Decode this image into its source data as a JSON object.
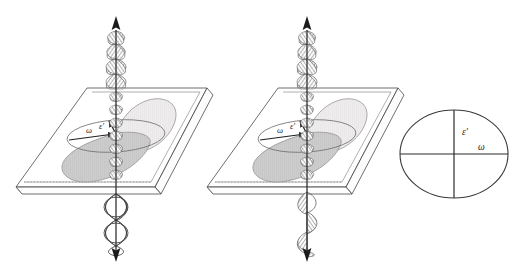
{
  "figure": {
    "type": "optical-polarization-schematic",
    "width": 527,
    "height": 265,
    "background_color": "#ffffff"
  },
  "colors": {
    "stroke": "#3a3a3a",
    "stroke_light": "#8c8c8c",
    "helix_fill": "#8e8e8e",
    "disk_gray": "#c9c9c9",
    "disk_light": "#eceaea",
    "label": "#1a1a1a",
    "dotted": "#9a9a9a"
  },
  "panels": [
    {
      "id": "panel-left",
      "name": "circular-polarization-panel",
      "plate": {
        "name": "birefringent-plate",
        "shape": "parallelogram-slab",
        "hidden_edge_style": "dotted"
      },
      "ellipse_cone": {
        "name": "polarization-ellipse-cone",
        "upper_fill": "#eceaea",
        "lower_fill": "#c9c9c9"
      },
      "axis_arrow": {
        "name": "propagation-axis",
        "top_arrow": "up",
        "bottom_arrow": "down"
      },
      "wave_above": {
        "name": "incident-helix-wave",
        "style": "hatched-double-helix",
        "turns": 4
      },
      "wave_below": {
        "name": "emergent-circular-wave",
        "style": "open-lens-rings",
        "turns": 3
      },
      "labels": [
        {
          "name": "omega-label",
          "text": "ω"
        },
        {
          "name": "epsilon-prime-label",
          "text": "ε′"
        }
      ]
    },
    {
      "id": "panel-middle",
      "name": "elliptical-polarization-panel",
      "plate": {
        "name": "birefringent-plate",
        "shape": "parallelogram-slab",
        "hidden_edge_style": "dotted"
      },
      "ellipse_cone": {
        "name": "polarization-ellipse-cone",
        "upper_fill": "#eceaea",
        "lower_fill": "#c9c9c9"
      },
      "axis_arrow": {
        "name": "propagation-axis",
        "top_arrow": "up",
        "bottom_arrow": "down"
      },
      "wave_above": {
        "name": "incident-helix-wave",
        "style": "hatched-double-helix",
        "turns": 4
      },
      "wave_below": {
        "name": "emergent-elliptical-helix",
        "style": "hatched-single-helix",
        "turns": 3
      },
      "labels": [
        {
          "name": "omega-label",
          "text": "ω"
        },
        {
          "name": "epsilon-prime-label",
          "text": "ε′"
        }
      ]
    },
    {
      "id": "panel-right",
      "name": "index-ellipse-panel",
      "ellipse": {
        "name": "index-ellipse",
        "cx": 454,
        "cy": 154,
        "rx": 54,
        "ry": 44,
        "fill": "none"
      },
      "axes": {
        "name": "crosshair-axes",
        "vertical": true,
        "horizontal": true
      },
      "labels": [
        {
          "name": "epsilon-prime-label",
          "text": "ε′"
        },
        {
          "name": "omega-label",
          "text": "ω"
        }
      ]
    }
  ]
}
